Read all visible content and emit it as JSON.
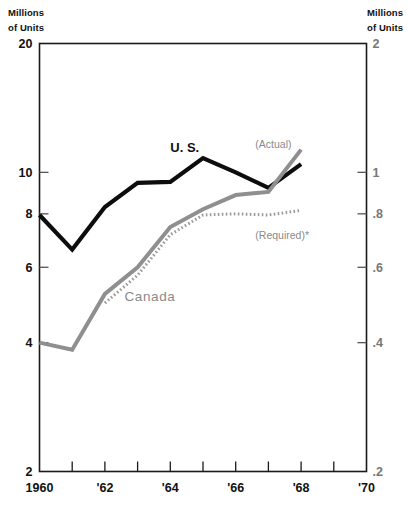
{
  "chart_data": {
    "type": "line",
    "title": "",
    "ylabel": "Millions of Units",
    "ylabel_right": "Millions of Units",
    "xlabel": "",
    "scale": "log",
    "grid": false,
    "legend": "inline-annotations",
    "ylim": [
      2,
      20
    ],
    "ylim_right": [
      0.2,
      2
    ],
    "xlim": [
      1960,
      1970
    ],
    "yticks": [
      20,
      10,
      8,
      6,
      4,
      2
    ],
    "ytick_labels": [
      "20",
      "10",
      "8",
      "6",
      "4",
      "2"
    ],
    "yticks_right": [
      2,
      1,
      0.8,
      0.6,
      0.4,
      0.2
    ],
    "ytick_labels_right": [
      "2",
      "1",
      ".8",
      ".6",
      ".4",
      ".2"
    ],
    "xticks": [
      1960,
      1961,
      1962,
      1963,
      1964,
      1965,
      1966,
      1967,
      1968,
      1969,
      1970
    ],
    "xtick_labels": [
      "1960",
      "",
      "'62",
      "",
      "'64",
      "",
      "'66",
      "",
      "'68",
      "",
      "'70"
    ],
    "x": [
      1960,
      1961,
      1962,
      1963,
      1964,
      1965,
      1966,
      1967,
      1968
    ],
    "series": [
      {
        "name": "U. S.",
        "axis": "left",
        "style": "solid",
        "color": "#0d0d0d",
        "values": [
          7.95,
          6.6,
          8.3,
          9.45,
          9.5,
          10.8,
          10.0,
          9.2,
          10.45
        ]
      },
      {
        "name": "Canada",
        "axis": "right",
        "style": "solid",
        "color": "#8f8f8f",
        "values": [
          0.4,
          0.385,
          0.52,
          0.6,
          0.745,
          0.82,
          0.885,
          0.9,
          1.13
        ]
      },
      {
        "name": "(Required)*",
        "axis": "right",
        "style": "dotted",
        "color": "#9a9a9a",
        "x": [
          1962,
          1963,
          1964,
          1965,
          1966,
          1967,
          1968
        ],
        "values": [
          0.495,
          0.575,
          0.715,
          0.795,
          0.8,
          0.795,
          0.815
        ]
      }
    ],
    "annotations": [
      {
        "text": "U. S.",
        "x": 1964.0,
        "y_px": 152,
        "style": "series-label-us"
      },
      {
        "text": "Canada",
        "x": 1962.6,
        "y_px": 301,
        "style": "series-label-ca"
      },
      {
        "text": "(Actual)",
        "x": 1966.6,
        "y_px": 148,
        "style": "annot"
      },
      {
        "text": "(Required)*",
        "x": 1966.6,
        "y_px": 239,
        "style": "annot"
      }
    ]
  },
  "labels": {
    "axis_left_title_line1": "Millions",
    "axis_left_title_line2": "of Units",
    "axis_right_title_line1": "Millions",
    "axis_right_title_line2": "of Units",
    "series_us": "U. S.",
    "series_canada": "Canada",
    "annot_actual": "(Actual)",
    "annot_required": "(Required)*"
  }
}
